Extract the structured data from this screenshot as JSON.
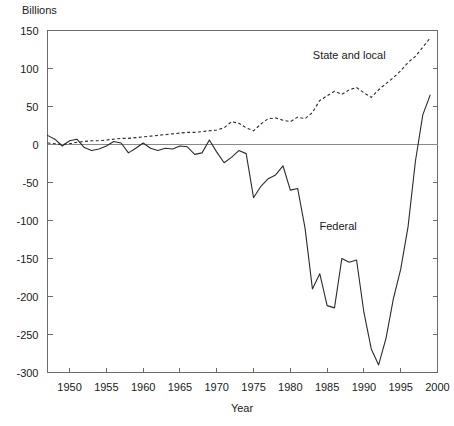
{
  "chart_data": {
    "type": "line",
    "title": "",
    "subtitle": "",
    "ylabel": "Billions",
    "xlabel": "Year",
    "xlim": [
      1947,
      2000
    ],
    "ylim": [
      -300,
      150
    ],
    "grid": false,
    "legend_position": "inline-annotations",
    "xticks": [
      1950,
      1955,
      1960,
      1965,
      1970,
      1975,
      1980,
      1985,
      1990,
      1995,
      2000
    ],
    "xtick_labels": [
      "1950",
      "1955",
      "1960",
      "1965",
      "1970",
      "1975",
      "1980",
      "1985",
      "1990",
      "1995",
      "2000"
    ],
    "yticks": [
      150,
      100,
      50,
      0,
      -50,
      -100,
      -150,
      -200,
      -250,
      -300
    ],
    "ytick_labels": [
      "150",
      "100",
      "50",
      "0",
      "-50",
      "-100",
      "-150",
      "-200",
      "-250",
      "-300"
    ],
    "annotations": [
      {
        "text": "State and local",
        "x": 1988,
        "y": 112
      },
      {
        "text": "Federal",
        "x": 1986.5,
        "y": -113
      }
    ],
    "x": [
      1947,
      1948,
      1949,
      1950,
      1951,
      1952,
      1953,
      1954,
      1955,
      1956,
      1957,
      1958,
      1959,
      1960,
      1961,
      1962,
      1963,
      1964,
      1965,
      1966,
      1967,
      1968,
      1969,
      1970,
      1971,
      1972,
      1973,
      1974,
      1975,
      1976,
      1977,
      1978,
      1979,
      1980,
      1981,
      1982,
      1983,
      1984,
      1985,
      1986,
      1987,
      1988,
      1989,
      1990,
      1991,
      1992,
      1993,
      1994,
      1995,
      1996,
      1997,
      1998,
      1999
    ],
    "series": [
      {
        "name": "Federal",
        "style": "solid",
        "values": [
          12,
          7,
          -2,
          5,
          7,
          -4,
          -8,
          -6,
          -2,
          4,
          2,
          -11,
          -5,
          2,
          -5,
          -8,
          -5,
          -6,
          -2,
          -3,
          -13,
          -11,
          6,
          -10,
          -24,
          -17,
          -8,
          -12,
          -70,
          -55,
          -45,
          -40,
          -28,
          -60,
          -58,
          -110,
          -190,
          -170,
          -212,
          -215,
          -150,
          -155,
          -152,
          -221,
          -269,
          -290,
          -255,
          -203,
          -164,
          -108,
          -22,
          39,
          65
        ]
      },
      {
        "name": "State and local",
        "style": "dashed",
        "values": [
          2,
          1,
          0,
          1,
          3,
          4,
          5,
          5,
          6,
          7,
          8,
          8,
          9,
          10,
          11,
          12,
          13,
          14,
          15,
          16,
          16,
          17,
          18,
          19,
          22,
          30,
          28,
          22,
          18,
          27,
          34,
          35,
          32,
          30,
          36,
          34,
          42,
          58,
          64,
          70,
          66,
          72,
          75,
          68,
          62,
          72,
          80,
          88,
          97,
          108,
          116,
          128,
          140
        ]
      }
    ]
  },
  "axis": {
    "ylabel": "Billions",
    "xlabel": "Year"
  }
}
